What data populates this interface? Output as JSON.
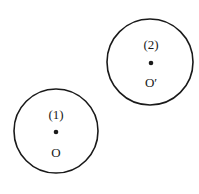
{
  "diagram": {
    "circles": [
      {
        "id": "1",
        "number_label": "(1)",
        "center_label": "O",
        "cx": 56,
        "cy": 131,
        "r": 42
      },
      {
        "id": "2",
        "number_label": "(2)",
        "center_label": "O′",
        "cx": 150,
        "cy": 62,
        "r": 43
      }
    ],
    "colors": {
      "stroke": "#1a1a1a",
      "background": "#ffffff"
    }
  }
}
